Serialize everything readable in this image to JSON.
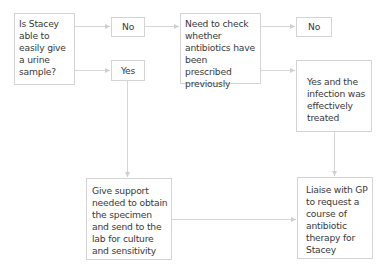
{
  "flowchart": {
    "nodes": {
      "question": {
        "label": "Is Stacey able to easily give a urine sample?"
      },
      "no_1": {
        "label": "No"
      },
      "yes_1": {
        "label": "Yes"
      },
      "check_antibiotics": {
        "label": "Need to check whether antibiotics have been prescribed previously"
      },
      "no_2": {
        "label": "No"
      },
      "yes_treated": {
        "label": "Yes and the infection was effectively treated"
      },
      "give_support": {
        "label": "Give support needed to obtain the specimen and send to the lab for culture and sensitivity"
      },
      "liaise_gp": {
        "label": "Liaise with GP to request a course of antibiotic therapy for Stacey"
      }
    },
    "edges": [
      {
        "from": "question",
        "to": "no_1"
      },
      {
        "from": "question",
        "to": "yes_1"
      },
      {
        "from": "no_1",
        "to": "check_antibiotics"
      },
      {
        "from": "check_antibiotics",
        "to": "no_2"
      },
      {
        "from": "check_antibiotics",
        "to": "yes_treated"
      },
      {
        "from": "yes_1",
        "to": "give_support"
      },
      {
        "from": "yes_treated",
        "to": "liaise_gp"
      },
      {
        "from": "give_support",
        "to": "liaise_gp"
      }
    ],
    "colors": {
      "border": "#d4d4d4",
      "connector": "#cfcfcf",
      "text": "#3a3a3a"
    }
  }
}
